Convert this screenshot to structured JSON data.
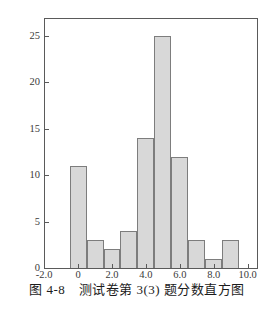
{
  "figure": {
    "caption": "图 4-8　测试卷第 3(3) 题分数直方图"
  },
  "chart_data": {
    "type": "bar",
    "subtype": "histogram",
    "title": "",
    "xlabel": "",
    "ylabel": "",
    "bin_centers": [
      0,
      1,
      2,
      3,
      4,
      5,
      6,
      7,
      8,
      9
    ],
    "bar_width": 1,
    "values": [
      11,
      3,
      2,
      4,
      14,
      25,
      12,
      3,
      1,
      3
    ],
    "xlim": [
      -1.95,
      10.55
    ],
    "ylim": [
      0,
      26.8
    ],
    "xticks": {
      "values": [
        -2,
        0,
        2,
        4,
        6,
        8,
        10
      ],
      "labels": [
        "-2.0",
        "0",
        "2.0",
        "4.0",
        "6.0",
        "8.0",
        "10.0"
      ]
    },
    "yticks": {
      "values": [
        0,
        5,
        10,
        15,
        20,
        25
      ],
      "labels": [
        "0",
        "5",
        "10",
        "15",
        "20",
        "25"
      ]
    },
    "grid": false,
    "legend": "none",
    "colors": {
      "background": "#ffffff",
      "bar_fill": "#d8d8d8",
      "bar_edge": "#7d7d7d",
      "frame": "#5a5a5a",
      "tick_label": "#3a3a3a",
      "caption": "#1c1c1c"
    }
  }
}
